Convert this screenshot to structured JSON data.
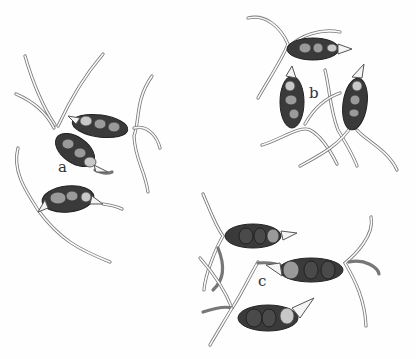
{
  "figure": {
    "labels": [
      {
        "id": "a",
        "text": "a",
        "x": 58,
        "y": 162
      },
      {
        "id": "b",
        "text": "b",
        "x": 309,
        "y": 80
      },
      {
        "id": "c",
        "text": "c",
        "x": 258,
        "y": 268
      }
    ],
    "groups": {
      "a": {
        "spore_count": 3
      },
      "b": {
        "spore_count": 3
      },
      "c": {
        "spore_count": 3
      }
    },
    "colors": {
      "background": "#fefefe",
      "spore_dark": "#3a3a3a",
      "hypha_outline": "#777777"
    }
  }
}
